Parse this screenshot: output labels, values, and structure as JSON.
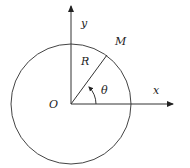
{
  "diagram": {
    "type": "polar-coordinate-circle",
    "labels": {
      "y_axis": "y",
      "x_axis": "x",
      "origin": "O",
      "radius": "R",
      "point": "M",
      "angle": "θ"
    },
    "geometry": {
      "center": [
        71,
        104
      ],
      "radius": 60,
      "point_M": [
        107,
        55
      ]
    },
    "colors": {
      "stroke": "#333333",
      "background": "#ffffff"
    }
  }
}
